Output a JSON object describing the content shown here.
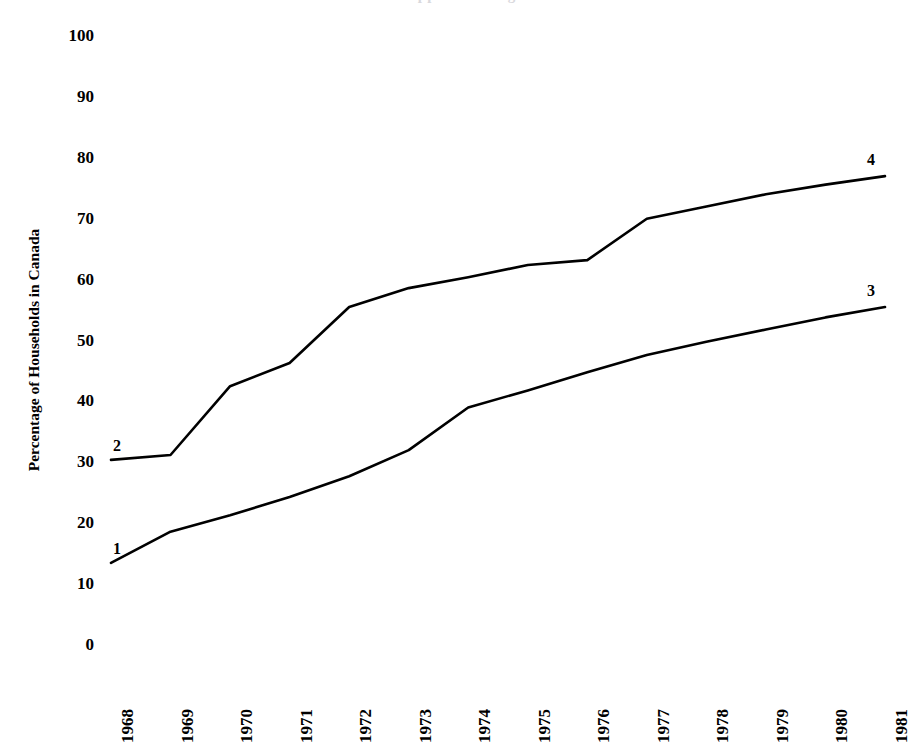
{
  "figure": {
    "title_fragment": "…clipped heading…",
    "background_color": "#ffffff",
    "line_color": "#000000"
  },
  "axes": {
    "y_axis_title": "Percentage of Households in Canada",
    "y_ticks": [
      "100",
      "90",
      "80",
      "70",
      "60",
      "50",
      "40",
      "30",
      "20",
      "10",
      "0"
    ],
    "x_ticks": [
      "1968",
      "1969",
      "1970",
      "1971",
      "1972",
      "1973",
      "1974",
      "1975",
      "1976",
      "1977",
      "1978",
      "1979",
      "1980",
      "1981"
    ]
  },
  "series_labels": {
    "start_upper": "2",
    "end_upper": "4",
    "start_lower": "1",
    "end_lower": "3"
  },
  "chart_data": {
    "type": "line",
    "title": "",
    "xlabel": "",
    "ylabel": "Percentage of Households in Canada",
    "xlim": [
      1968,
      1981
    ],
    "ylim": [
      0,
      100
    ],
    "ytick_values": [
      0,
      10,
      20,
      30,
      40,
      50,
      60,
      70,
      80,
      90,
      100
    ],
    "grid": false,
    "legend": "endpoint-labels",
    "x": [
      1968,
      1969,
      1970,
      1971,
      1972,
      1973,
      1974,
      1975,
      1976,
      1977,
      1978,
      1979,
      1980,
      1981
    ],
    "series": [
      {
        "name": "Upper curve (labelled 2 at start, 4 at end)",
        "start_label": "2",
        "end_label": "4",
        "values": [
          30.4,
          31.2,
          42.5,
          46.3,
          55.5,
          58.6,
          60.4,
          62.4,
          63.2,
          70.0,
          72.0,
          74.0,
          75.6,
          77.0
        ]
      },
      {
        "name": "Lower curve (labelled 1 at start, 3 at end)",
        "start_label": "1",
        "end_label": "3",
        "values": [
          13.5,
          18.6,
          21.3,
          24.3,
          27.7,
          32.0,
          39.0,
          41.8,
          44.8,
          47.6,
          49.8,
          51.8,
          53.8,
          55.5
        ]
      }
    ]
  }
}
